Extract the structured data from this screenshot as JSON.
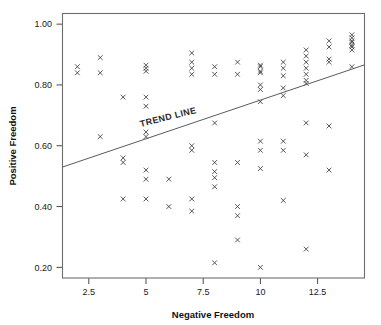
{
  "chart_data": {
    "type": "scatter",
    "title": "",
    "xlabel": "Negative Freedom",
    "ylabel": "Positive Freedom",
    "xlim": [
      1.35,
      14.55
    ],
    "ylim": [
      0.165,
      1.035
    ],
    "xticks": [
      2.5,
      5,
      7.5,
      10,
      12.5
    ],
    "xtick_labels": [
      "2.5",
      "5",
      "7.5",
      "10",
      "12.5"
    ],
    "yticks": [
      0.2,
      0.4,
      0.6,
      0.8,
      1.0
    ],
    "ytick_labels": [
      "0.20",
      "0.40",
      "0.60",
      "0.80",
      "1.00"
    ],
    "grid": false,
    "legend": null,
    "marker": "x",
    "annotations": [
      {
        "text": "TREND LINE",
        "x": 6.0,
        "y": 0.685,
        "rotation": -14
      }
    ],
    "trend_line": {
      "label": "TREND LINE",
      "x": [
        1.35,
        14.55
      ],
      "y": [
        0.53,
        0.866
      ],
      "slope": 0.0255,
      "intercept": 0.4956
    },
    "points": [
      {
        "x": 2,
        "y": 0.86
      },
      {
        "x": 2,
        "y": 0.84
      },
      {
        "x": 3,
        "y": 0.89
      },
      {
        "x": 3,
        "y": 0.84
      },
      {
        "x": 3,
        "y": 0.63
      },
      {
        "x": 4,
        "y": 0.76
      },
      {
        "x": 4,
        "y": 0.56
      },
      {
        "x": 4,
        "y": 0.545
      },
      {
        "x": 4,
        "y": 0.425
      },
      {
        "x": 5,
        "y": 0.865
      },
      {
        "x": 5,
        "y": 0.855
      },
      {
        "x": 5,
        "y": 0.845
      },
      {
        "x": 5,
        "y": 0.76
      },
      {
        "x": 5,
        "y": 0.73
      },
      {
        "x": 5,
        "y": 0.645
      },
      {
        "x": 5,
        "y": 0.63
      },
      {
        "x": 5,
        "y": 0.52
      },
      {
        "x": 5,
        "y": 0.49
      },
      {
        "x": 5,
        "y": 0.425
      },
      {
        "x": 6,
        "y": 0.49
      },
      {
        "x": 6,
        "y": 0.4
      },
      {
        "x": 7,
        "y": 0.905
      },
      {
        "x": 7,
        "y": 0.875
      },
      {
        "x": 7,
        "y": 0.855
      },
      {
        "x": 7,
        "y": 0.835
      },
      {
        "x": 7,
        "y": 0.6
      },
      {
        "x": 7,
        "y": 0.585
      },
      {
        "x": 7,
        "y": 0.425
      },
      {
        "x": 7,
        "y": 0.385
      },
      {
        "x": 8,
        "y": 0.86
      },
      {
        "x": 8,
        "y": 0.835
      },
      {
        "x": 8,
        "y": 0.675
      },
      {
        "x": 8,
        "y": 0.545
      },
      {
        "x": 8,
        "y": 0.515
      },
      {
        "x": 8,
        "y": 0.495
      },
      {
        "x": 8,
        "y": 0.465
      },
      {
        "x": 8,
        "y": 0.215
      },
      {
        "x": 9,
        "y": 0.875
      },
      {
        "x": 9,
        "y": 0.835
      },
      {
        "x": 9,
        "y": 0.545
      },
      {
        "x": 9,
        "y": 0.4
      },
      {
        "x": 9,
        "y": 0.37
      },
      {
        "x": 9,
        "y": 0.29
      },
      {
        "x": 10,
        "y": 0.865
      },
      {
        "x": 10,
        "y": 0.86
      },
      {
        "x": 10,
        "y": 0.845
      },
      {
        "x": 10,
        "y": 0.84
      },
      {
        "x": 10,
        "y": 0.8
      },
      {
        "x": 10,
        "y": 0.785
      },
      {
        "x": 10,
        "y": 0.745
      },
      {
        "x": 10,
        "y": 0.615
      },
      {
        "x": 10,
        "y": 0.585
      },
      {
        "x": 10,
        "y": 0.525
      },
      {
        "x": 10,
        "y": 0.2
      },
      {
        "x": 11,
        "y": 0.875
      },
      {
        "x": 11,
        "y": 0.855
      },
      {
        "x": 11,
        "y": 0.83
      },
      {
        "x": 11,
        "y": 0.79
      },
      {
        "x": 11,
        "y": 0.765
      },
      {
        "x": 11,
        "y": 0.615
      },
      {
        "x": 11,
        "y": 0.585
      },
      {
        "x": 11,
        "y": 0.42
      },
      {
        "x": 12,
        "y": 0.915
      },
      {
        "x": 12,
        "y": 0.895
      },
      {
        "x": 12,
        "y": 0.875
      },
      {
        "x": 12,
        "y": 0.855
      },
      {
        "x": 12,
        "y": 0.835
      },
      {
        "x": 12,
        "y": 0.815
      },
      {
        "x": 12,
        "y": 0.805
      },
      {
        "x": 12,
        "y": 0.675
      },
      {
        "x": 12,
        "y": 0.57
      },
      {
        "x": 12,
        "y": 0.26
      },
      {
        "x": 13,
        "y": 0.945
      },
      {
        "x": 13,
        "y": 0.925
      },
      {
        "x": 13,
        "y": 0.885
      },
      {
        "x": 13,
        "y": 0.875
      },
      {
        "x": 13,
        "y": 0.665
      },
      {
        "x": 13,
        "y": 0.52
      },
      {
        "x": 14,
        "y": 0.965
      },
      {
        "x": 14,
        "y": 0.955
      },
      {
        "x": 14,
        "y": 0.945
      },
      {
        "x": 14,
        "y": 0.94
      },
      {
        "x": 14,
        "y": 0.93
      },
      {
        "x": 14,
        "y": 0.925
      },
      {
        "x": 14,
        "y": 0.915
      },
      {
        "x": 14,
        "y": 0.86
      }
    ]
  }
}
